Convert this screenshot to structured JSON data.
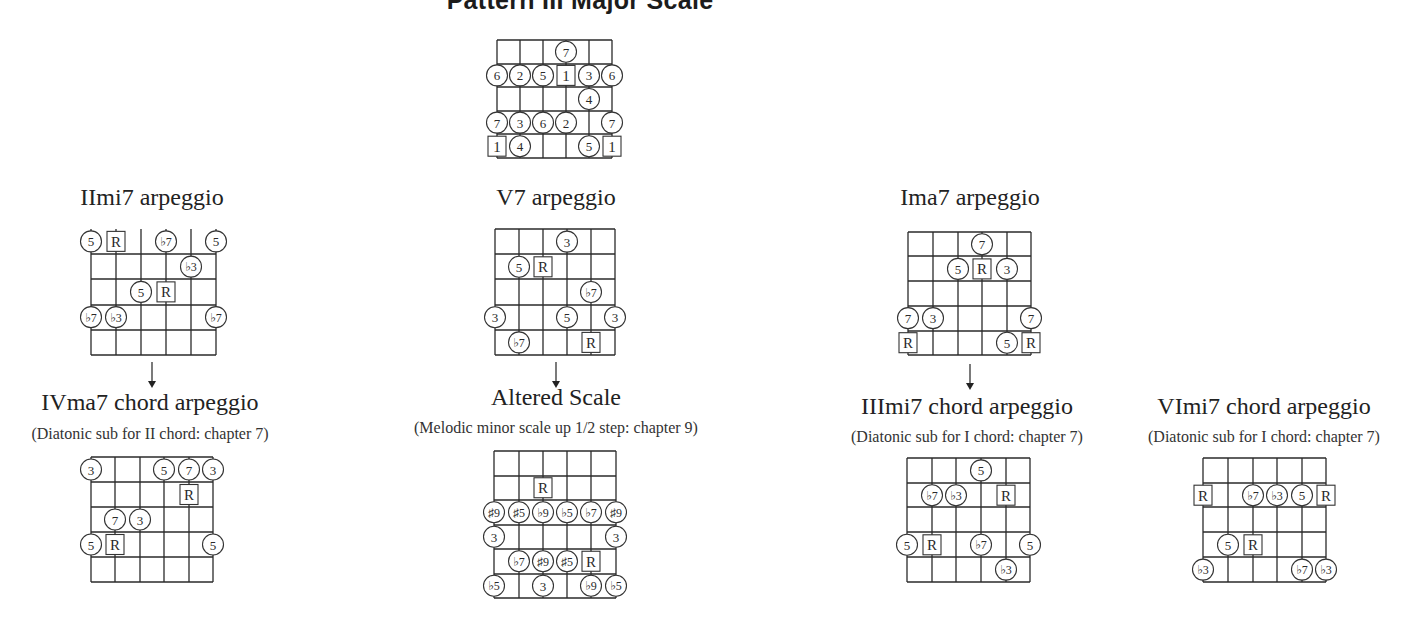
{
  "main_title": "Pattern III Major Scale",
  "colors": {
    "line": "#2a2a2a",
    "background": "#ffffff",
    "text": "#222222"
  },
  "diagrams": [
    {
      "id": "pattern-iii-major-scale",
      "title": "",
      "subtitle": "",
      "strings_x": [
        497,
        520,
        543,
        566,
        589,
        612
      ],
      "frets_y": [
        40,
        64,
        87,
        111,
        134,
        158
      ],
      "top_line": true,
      "markers": [
        {
          "s": 3,
          "r": 0.5,
          "label": "7",
          "shape": "circle"
        },
        {
          "s": 0,
          "r": 1.5,
          "label": "6",
          "shape": "circle"
        },
        {
          "s": 1,
          "r": 1.5,
          "label": "2",
          "shape": "circle"
        },
        {
          "s": 2,
          "r": 1.5,
          "label": "5",
          "shape": "circle"
        },
        {
          "s": 3,
          "r": 1.5,
          "label": "1",
          "shape": "square"
        },
        {
          "s": 4,
          "r": 1.5,
          "label": "3",
          "shape": "circle"
        },
        {
          "s": 5,
          "r": 1.5,
          "label": "6",
          "shape": "circle"
        },
        {
          "s": 4,
          "r": 2.5,
          "label": "4",
          "shape": "circle"
        },
        {
          "s": 0,
          "r": 3.5,
          "label": "7",
          "shape": "circle"
        },
        {
          "s": 1,
          "r": 3.5,
          "label": "3",
          "shape": "circle"
        },
        {
          "s": 2,
          "r": 3.5,
          "label": "6",
          "shape": "circle"
        },
        {
          "s": 3,
          "r": 3.5,
          "label": "2",
          "shape": "circle"
        },
        {
          "s": 5,
          "r": 3.5,
          "label": "7",
          "shape": "circle"
        },
        {
          "s": 0,
          "r": 4.5,
          "label": "1",
          "shape": "square"
        },
        {
          "s": 1,
          "r": 4.5,
          "label": "4",
          "shape": "circle"
        },
        {
          "s": 4,
          "r": 4.5,
          "label": "5",
          "shape": "circle"
        },
        {
          "s": 5,
          "r": 4.5,
          "label": "1",
          "shape": "square"
        }
      ]
    },
    {
      "id": "iimi7-arpeggio",
      "title": "IImi7 arpeggio",
      "title_pos": {
        "cx": 152,
        "top": 184
      },
      "subtitle": "",
      "strings_x": [
        91,
        116,
        141,
        166,
        191,
        216
      ],
      "frets_y": [
        254,
        279,
        305,
        330,
        355
      ],
      "string_top": 229,
      "top_line": true,
      "open_top": true,
      "markers": [
        {
          "s": 0,
          "r": -0.5,
          "label": "5",
          "shape": "circle"
        },
        {
          "s": 1,
          "r": -0.5,
          "label": "R",
          "shape": "square"
        },
        {
          "s": 3,
          "r": -0.5,
          "label": "♭7",
          "shape": "circle"
        },
        {
          "s": 5,
          "r": -0.5,
          "label": "5",
          "shape": "circle"
        },
        {
          "s": 4,
          "r": 0.5,
          "label": "♭3",
          "shape": "circle"
        },
        {
          "s": 2,
          "r": 1.5,
          "label": "5",
          "shape": "circle"
        },
        {
          "s": 3,
          "r": 1.5,
          "label": "R",
          "shape": "square"
        },
        {
          "s": 0,
          "r": 2.5,
          "label": "♭7",
          "shape": "circle"
        },
        {
          "s": 1,
          "r": 2.5,
          "label": "♭3",
          "shape": "circle"
        },
        {
          "s": 5,
          "r": 2.5,
          "label": "♭7",
          "shape": "circle"
        }
      ],
      "arrow": {
        "x": 152,
        "y1": 362,
        "y2": 388
      }
    },
    {
      "id": "v7-arpeggio",
      "title": "V7 arpeggio",
      "title_pos": {
        "cx": 556,
        "top": 184
      },
      "subtitle": "",
      "strings_x": [
        495,
        519,
        543,
        567,
        591,
        615
      ],
      "frets_y": [
        229,
        254,
        279,
        305,
        330,
        355
      ],
      "top_line": true,
      "markers": [
        {
          "s": 3,
          "r": 0.5,
          "label": "3",
          "shape": "circle"
        },
        {
          "s": 1,
          "r": 1.5,
          "label": "5",
          "shape": "circle"
        },
        {
          "s": 2,
          "r": 1.5,
          "label": "R",
          "shape": "square"
        },
        {
          "s": 4,
          "r": 2.5,
          "label": "♭7",
          "shape": "circle"
        },
        {
          "s": 0,
          "r": 3.5,
          "label": "3",
          "shape": "circle"
        },
        {
          "s": 3,
          "r": 3.5,
          "label": "5",
          "shape": "circle"
        },
        {
          "s": 5,
          "r": 3.5,
          "label": "3",
          "shape": "circle"
        },
        {
          "s": 1,
          "r": 4.5,
          "label": "♭7",
          "shape": "circle"
        },
        {
          "s": 4,
          "r": 4.5,
          "label": "R",
          "shape": "square"
        }
      ],
      "arrow": {
        "x": 556,
        "y1": 362,
        "y2": 388
      }
    },
    {
      "id": "ima7-arpeggio",
      "title": "Ima7 arpeggio",
      "title_pos": {
        "cx": 970,
        "top": 184
      },
      "subtitle": "",
      "strings_x": [
        908,
        933,
        958,
        982,
        1007,
        1031
      ],
      "frets_y": [
        232,
        256,
        281,
        306,
        331,
        355
      ],
      "top_line": true,
      "markers": [
        {
          "s": 3,
          "r": 0.5,
          "label": "7",
          "shape": "circle"
        },
        {
          "s": 2,
          "r": 1.5,
          "label": "5",
          "shape": "circle"
        },
        {
          "s": 3,
          "r": 1.5,
          "label": "R",
          "shape": "square"
        },
        {
          "s": 4,
          "r": 1.5,
          "label": "3",
          "shape": "circle"
        },
        {
          "s": 0,
          "r": 3.5,
          "label": "7",
          "shape": "circle"
        },
        {
          "s": 1,
          "r": 3.5,
          "label": "3",
          "shape": "circle"
        },
        {
          "s": 5,
          "r": 3.5,
          "label": "7",
          "shape": "circle"
        },
        {
          "s": 0,
          "r": 4.5,
          "label": "R",
          "shape": "square"
        },
        {
          "s": 4,
          "r": 4.5,
          "label": "5",
          "shape": "circle"
        },
        {
          "s": 5,
          "r": 4.5,
          "label": "R",
          "shape": "square"
        }
      ],
      "arrow": {
        "x": 970,
        "y1": 364,
        "y2": 390
      }
    },
    {
      "id": "ivma7-chord-arpeggio",
      "title": "IVma7 chord arpeggio",
      "title_pos": {
        "cx": 150,
        "top": 389
      },
      "subtitle": "(Diatonic sub for II chord: chapter 7)",
      "subtitle_pos": {
        "cx": 150,
        "top": 425
      },
      "strings_x": [
        91,
        115,
        140,
        164,
        189,
        213
      ],
      "frets_y": [
        457,
        482,
        507,
        532,
        557,
        582
      ],
      "top_line": true,
      "markers": [
        {
          "s": 0,
          "r": 0.5,
          "label": "3",
          "shape": "circle"
        },
        {
          "s": 3,
          "r": 0.5,
          "label": "5",
          "shape": "circle"
        },
        {
          "s": 4,
          "r": 0.5,
          "label": "7",
          "shape": "circle"
        },
        {
          "s": 5,
          "r": 0.5,
          "label": "3",
          "shape": "circle"
        },
        {
          "s": 4,
          "r": 1.5,
          "label": "R",
          "shape": "square"
        },
        {
          "s": 1,
          "r": 2.5,
          "label": "7",
          "shape": "circle"
        },
        {
          "s": 2,
          "r": 2.5,
          "label": "3",
          "shape": "circle"
        },
        {
          "s": 0,
          "r": 3.5,
          "label": "5",
          "shape": "circle"
        },
        {
          "s": 1,
          "r": 3.5,
          "label": "R",
          "shape": "square"
        },
        {
          "s": 5,
          "r": 3.5,
          "label": "5",
          "shape": "circle"
        }
      ]
    },
    {
      "id": "altered-scale",
      "title": "Altered Scale",
      "title_pos": {
        "cx": 556,
        "top": 384
      },
      "subtitle": "(Melodic minor scale up 1/2 step: chapter 9)",
      "subtitle_pos": {
        "cx": 556,
        "top": 419
      },
      "strings_x": [
        494,
        519,
        543,
        567,
        591,
        616
      ],
      "frets_y": [
        451,
        476,
        500,
        525,
        549,
        574,
        598
      ],
      "top_line": true,
      "markers": [
        {
          "s": 2,
          "r": 1.5,
          "label": "R",
          "shape": "square"
        },
        {
          "s": 0,
          "r": 2.5,
          "label": "♯9",
          "shape": "circle"
        },
        {
          "s": 1,
          "r": 2.5,
          "label": "♯5",
          "shape": "circle"
        },
        {
          "s": 2,
          "r": 2.5,
          "label": "♭9",
          "shape": "circle"
        },
        {
          "s": 3,
          "r": 2.5,
          "label": "♭5",
          "shape": "circle"
        },
        {
          "s": 4,
          "r": 2.5,
          "label": "♭7",
          "shape": "circle"
        },
        {
          "s": 5,
          "r": 2.5,
          "label": "♯9",
          "shape": "circle"
        },
        {
          "s": 0,
          "r": 3.5,
          "label": "3",
          "shape": "circle"
        },
        {
          "s": 5,
          "r": 3.5,
          "label": "3",
          "shape": "circle"
        },
        {
          "s": 1,
          "r": 4.5,
          "label": "♭7",
          "shape": "circle"
        },
        {
          "s": 2,
          "r": 4.5,
          "label": "♯9",
          "shape": "circle"
        },
        {
          "s": 3,
          "r": 4.5,
          "label": "♯5",
          "shape": "circle"
        },
        {
          "s": 4,
          "r": 4.5,
          "label": "R",
          "shape": "square"
        },
        {
          "s": 0,
          "r": 5.5,
          "label": "♭5",
          "shape": "circle"
        },
        {
          "s": 2,
          "r": 5.5,
          "label": "3",
          "shape": "circle"
        },
        {
          "s": 4,
          "r": 5.5,
          "label": "♭9",
          "shape": "circle"
        },
        {
          "s": 5,
          "r": 5.5,
          "label": "♭5",
          "shape": "circle"
        }
      ]
    },
    {
      "id": "iiimi7-chord-arpeggio",
      "title": "IIImi7 chord arpeggio",
      "title_pos": {
        "cx": 967,
        "top": 393
      },
      "subtitle": "(Diatonic sub for I chord: chapter 7)",
      "subtitle_pos": {
        "cx": 967,
        "top": 428
      },
      "strings_x": [
        907,
        932,
        956,
        981,
        1006,
        1030
      ],
      "frets_y": [
        458,
        483,
        507,
        532,
        557,
        582
      ],
      "top_line": true,
      "markers": [
        {
          "s": 3,
          "r": 0.5,
          "label": "5",
          "shape": "circle"
        },
        {
          "s": 1,
          "r": 1.5,
          "label": "♭7",
          "shape": "circle"
        },
        {
          "s": 2,
          "r": 1.5,
          "label": "♭3",
          "shape": "circle"
        },
        {
          "s": 4,
          "r": 1.5,
          "label": "R",
          "shape": "square"
        },
        {
          "s": 0,
          "r": 3.5,
          "label": "5",
          "shape": "circle"
        },
        {
          "s": 1,
          "r": 3.5,
          "label": "R",
          "shape": "square"
        },
        {
          "s": 3,
          "r": 3.5,
          "label": "♭7",
          "shape": "circle"
        },
        {
          "s": 5,
          "r": 3.5,
          "label": "5",
          "shape": "circle"
        },
        {
          "s": 4,
          "r": 4.5,
          "label": "♭3",
          "shape": "circle"
        }
      ]
    },
    {
      "id": "vimi7-chord-arpeggio",
      "title": "VImi7 chord arpeggio",
      "title_pos": {
        "cx": 1264,
        "top": 393
      },
      "subtitle": "(Diatonic sub for I chord: chapter 7)",
      "subtitle_pos": {
        "cx": 1264,
        "top": 428
      },
      "strings_x": [
        1203,
        1228,
        1253,
        1277,
        1302,
        1326
      ],
      "frets_y": [
        458,
        483,
        507,
        532,
        557,
        582
      ],
      "top_line": true,
      "markers": [
        {
          "s": 0,
          "r": 1.5,
          "label": "R",
          "shape": "square"
        },
        {
          "s": 2,
          "r": 1.5,
          "label": "♭7",
          "shape": "circle"
        },
        {
          "s": 3,
          "r": 1.5,
          "label": "♭3",
          "shape": "circle"
        },
        {
          "s": 4,
          "r": 1.5,
          "label": "5",
          "shape": "circle"
        },
        {
          "s": 5,
          "r": 1.5,
          "label": "R",
          "shape": "square"
        },
        {
          "s": 1,
          "r": 3.5,
          "label": "5",
          "shape": "circle"
        },
        {
          "s": 2,
          "r": 3.5,
          "label": "R",
          "shape": "square"
        },
        {
          "s": 0,
          "r": 4.5,
          "label": "♭3",
          "shape": "circle"
        },
        {
          "s": 4,
          "r": 4.5,
          "label": "♭7",
          "shape": "circle"
        },
        {
          "s": 5,
          "r": 4.5,
          "label": "♭3",
          "shape": "circle"
        }
      ]
    }
  ]
}
